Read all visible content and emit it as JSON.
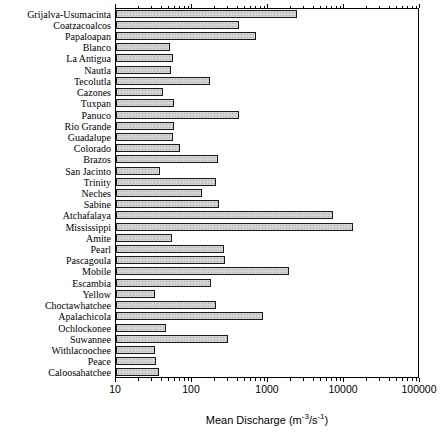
{
  "figure": {
    "background": "#ffffff",
    "bar_fill": "#d4d4d4",
    "bar_stipple": "#a9a9a9",
    "bar_border": "#1a1a1a",
    "axis_color": "#000000"
  },
  "chart_data": {
    "type": "bar",
    "orientation": "horizontal",
    "x_scale": "log",
    "xlim": [
      10,
      100000
    ],
    "x_ticks": [
      10,
      100,
      1000,
      10000,
      100000
    ],
    "x_tick_labels": [
      "10",
      "100",
      "1000",
      "10000",
      "100000"
    ],
    "xlabel": "Mean Discharge (m-3/s-1)",
    "xlabel_parts": {
      "pre": "Mean Discharge (m",
      "sup1": "-3",
      "mid": "/s",
      "sup2": "-1",
      "post": ")"
    },
    "ylabel": "",
    "title": "",
    "grid": false,
    "legend": null,
    "categories": [
      "Grijalva-Usumacinta",
      "Coatzacoalcos",
      "Papaloapan",
      "Blanco",
      "La Antigua",
      "Nautla",
      "Tecolutla",
      "Cazones",
      "Tuxpan",
      "Panuco",
      "Rio Grande",
      "Guadalupe",
      "Colorado",
      "Brazos",
      "San Jacinto",
      "Trinity",
      "Neches",
      "Sabine",
      "Atchafalaya",
      "Mississippi",
      "Amite",
      "Pearl",
      "Pascagoula",
      "Mobile",
      "Escambia",
      "Yellow",
      "Choctawhatchee",
      "Apalachicola",
      "Ochlockonee",
      "Suwannee",
      "Withlacoochee",
      "Peace",
      "Caloosahatchee"
    ],
    "values": [
      2400,
      420,
      700,
      51,
      57,
      53,
      170,
      41,
      58,
      415,
      58,
      57,
      69,
      220,
      38,
      205,
      137,
      230,
      7200,
      13000,
      55,
      263,
      270,
      1900,
      176,
      33,
      205,
      865,
      46,
      300,
      33,
      34,
      37
    ]
  }
}
